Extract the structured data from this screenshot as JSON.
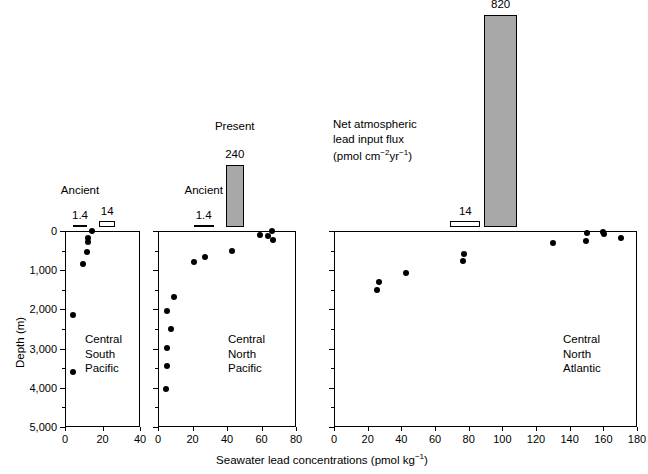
{
  "figure": {
    "xlabel_main": "Seawater lead concentrations (pmol kg",
    "xlabel_sup": "−1",
    "xlabel_tail": ")",
    "ylabel": "Depth (m)",
    "flux_note_line1": "Net atmospheric",
    "flux_note_line2": "lead input flux",
    "flux_note_line3_a": "(pmol cm",
    "flux_note_line3_sup1": "−2",
    "flux_note_line3_b": "yr",
    "flux_note_line3_sup2": "−1",
    "flux_note_line3_c": ")",
    "label_ancient": "Ancient",
    "label_present": "Present",
    "dot_color": "#000000",
    "bar_fill_color": "#a8a8a8",
    "axis_color": "#000000"
  },
  "chart_data": {
    "type": "scatter",
    "title": "",
    "xlabel": "Seawater lead concentrations (pmol kg−1)",
    "ylabel": "Depth (m)",
    "ylim": [
      0,
      5000
    ],
    "y_inverted": true,
    "y_ticks": [
      0,
      1000,
      2000,
      3000,
      4000,
      5000
    ],
    "y_tick_labels": [
      "0",
      "1,000",
      "2,000",
      "3,000",
      "4,000",
      "5,000"
    ],
    "y_minor_ticks": [
      500,
      1500,
      2500,
      3500,
      4500
    ],
    "grid": false,
    "legend": "none",
    "panels": [
      {
        "name": "Central South Pacific",
        "caption_lines": [
          "Central",
          "South",
          "Pacific"
        ],
        "xlim": [
          0,
          40
        ],
        "x_ticks": [
          0,
          20,
          40
        ],
        "x_tick_labels": [
          "0",
          "20",
          "40"
        ],
        "y_axis_shown": true,
        "points": [
          {
            "x": 14.5,
            "y": 10
          },
          {
            "x": 12.5,
            "y": 175
          },
          {
            "x": 12.0,
            "y": 290
          },
          {
            "x": 11.5,
            "y": 540
          },
          {
            "x": 9.5,
            "y": 830
          },
          {
            "x": 4.5,
            "y": 2150
          },
          {
            "x": 4.5,
            "y": 3590
          }
        ],
        "flux_bars": [
          {
            "label": "Ancient",
            "value": "1.4",
            "style": "line",
            "x_center": 8.0,
            "width_units": 7.0
          },
          {
            "label": "",
            "value": "14",
            "style": "open",
            "x_center": 22.5,
            "width_units": 8.5
          }
        ]
      },
      {
        "name": "Central North Pacific",
        "caption_lines": [
          "Central",
          "North",
          "Pacific"
        ],
        "xlim": [
          0,
          80
        ],
        "x_ticks": [
          0,
          20,
          40,
          60,
          80
        ],
        "x_tick_labels": [
          "0",
          "20",
          "40",
          "60",
          "80"
        ],
        "y_axis_shown": false,
        "points": [
          {
            "x": 66.0,
            "y": 10
          },
          {
            "x": 59.0,
            "y": 95
          },
          {
            "x": 63.5,
            "y": 120
          },
          {
            "x": 66.5,
            "y": 240
          },
          {
            "x": 43.0,
            "y": 500
          },
          {
            "x": 27.5,
            "y": 660
          },
          {
            "x": 21.0,
            "y": 790
          },
          {
            "x": 9.5,
            "y": 1680
          },
          {
            "x": 5.5,
            "y": 2040
          },
          {
            "x": 7.5,
            "y": 2500
          },
          {
            "x": 5.0,
            "y": 2980
          },
          {
            "x": 5.5,
            "y": 3450
          },
          {
            "x": 4.5,
            "y": 4020
          }
        ],
        "flux_bars": [
          {
            "label": "Ancient",
            "value": "1.4",
            "style": "line",
            "x_center": 26.5,
            "width_units": 11.5
          },
          {
            "label": "Present",
            "value": "240",
            "style": "filled",
            "x_center": 44.5,
            "width_units": 10.5
          }
        ]
      },
      {
        "name": "Central North Atlantic",
        "caption_lines": [
          "Central",
          "North",
          "Atlantic"
        ],
        "xlim": [
          0,
          180
        ],
        "x_ticks": [
          0,
          20,
          40,
          60,
          80,
          100,
          120,
          140,
          160,
          180
        ],
        "x_tick_labels": [
          "0",
          "20",
          "40",
          "60",
          "80",
          "100",
          "120",
          "140",
          "160",
          "180"
        ],
        "y_axis_shown": false,
        "points": [
          {
            "x": 150.0,
            "y": 50
          },
          {
            "x": 160.0,
            "y": 30
          },
          {
            "x": 160.5,
            "y": 85
          },
          {
            "x": 170.5,
            "y": 170
          },
          {
            "x": 149.5,
            "y": 260
          },
          {
            "x": 130.0,
            "y": 300
          },
          {
            "x": 77.0,
            "y": 590
          },
          {
            "x": 76.5,
            "y": 760
          },
          {
            "x": 42.5,
            "y": 1060
          },
          {
            "x": 26.5,
            "y": 1300
          },
          {
            "x": 25.5,
            "y": 1500
          }
        ],
        "flux_bars": [
          {
            "label": "",
            "value": "14",
            "style": "open",
            "x_center": 78.0,
            "width_units": 18.0
          },
          {
            "label": "",
            "value": "820",
            "style": "filled",
            "x_center": 99.0,
            "width_units": 20.0
          }
        ]
      }
    ],
    "flux_axis_note": "Net atmospheric lead input flux (pmol cm−2 yr−1)",
    "flux_values": {
      "ancient_1": "1.4",
      "present_14": "14",
      "present_240": "240",
      "present_820": "820"
    }
  }
}
